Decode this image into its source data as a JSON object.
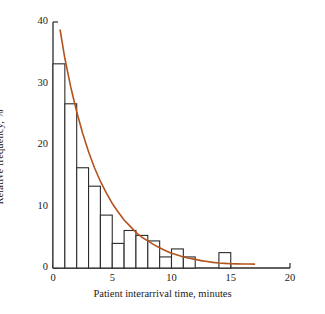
{
  "chart_data": {
    "type": "bar",
    "title": "",
    "xlabel": "Patient interarrival time, minutes",
    "ylabel": "Relative frequency, %",
    "xlim": [
      0,
      20
    ],
    "ylim": [
      0,
      40
    ],
    "xticks": [
      0,
      5,
      10,
      15,
      20
    ],
    "xtick_labels": [
      "0",
      "5",
      "10",
      "15",
      "20"
    ],
    "yticks": [
      0,
      10,
      20,
      30,
      40
    ],
    "ytick_labels": [
      "0",
      "10",
      "20",
      "30",
      "40"
    ],
    "grid": false,
    "legend": false,
    "bin_width": 1,
    "bin_edges": [
      0,
      1,
      2,
      3,
      4,
      5,
      6,
      7,
      8,
      9,
      10,
      11,
      12,
      13,
      14,
      15
    ],
    "categories": [
      "0-1",
      "1-2",
      "2-3",
      "3-4",
      "4-5",
      "5-6",
      "6-7",
      "7-8",
      "8-9",
      "9-10",
      "10-11",
      "11-12",
      "12-13",
      "13-14",
      "14-15"
    ],
    "values": [
      33.2,
      26.7,
      16.3,
      13.3,
      8.6,
      4.0,
      6.1,
      5.3,
      4.4,
      1.8,
      3.1,
      1.8,
      0.0,
      0.0,
      2.5
    ],
    "bar_fill": "#ffffff",
    "bar_edge": "#2b2b2b",
    "series": [
      {
        "name": "fitted exponential curve",
        "type": "line",
        "color": "#b3541e",
        "x": [
          0.6,
          1,
          1.5,
          2,
          2.5,
          3,
          3.5,
          4,
          4.5,
          5,
          5.5,
          6,
          6.5,
          7,
          7.5,
          8,
          8.5,
          9,
          9.5,
          10,
          10.5,
          11,
          11.5,
          12,
          12.5,
          13,
          13.5,
          14,
          14.5,
          15,
          15.5,
          16,
          16.5,
          17
        ],
        "y": [
          38.7,
          34.1,
          29.4,
          25.4,
          21.9,
          18.9,
          16.3,
          14.1,
          12.2,
          10.5,
          9.1,
          7.8,
          6.8,
          5.8,
          5.0,
          4.4,
          3.8,
          3.3,
          2.8,
          2.4,
          2.1,
          1.8,
          1.6,
          1.4,
          1.2,
          1.05,
          0.92,
          0.82,
          0.75,
          0.7,
          0.67,
          0.65,
          0.64,
          0.63
        ]
      }
    ]
  },
  "axis": {
    "axis_color": "#2b2b2b",
    "text_color": "#1a1a1a"
  }
}
